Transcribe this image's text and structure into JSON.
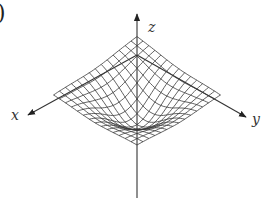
{
  "figure": {
    "part_label": ")",
    "axes": {
      "x_label": "x",
      "y_label": "y",
      "z_label": "z"
    },
    "surface": {
      "type": "wireframe",
      "shape": "downward peak with raised edges (saddle-like wings)",
      "grid_lines_per_direction": 14
    },
    "colors": {
      "line": "#333333",
      "background": "#ffffff"
    }
  }
}
